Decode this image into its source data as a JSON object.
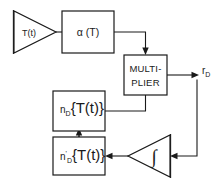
{
  "diagram": {
    "type": "block-diagram",
    "background_color": "#ffffff",
    "line_color": "#1a1a1a",
    "nodes": [
      {
        "id": "input-amplifier",
        "shape": "triangle-right",
        "label": "T(t)",
        "x": 12,
        "y": 11,
        "w": 44,
        "h": 42
      },
      {
        "id": "alpha-block",
        "shape": "rectangle",
        "label": "α (T)",
        "x": 62,
        "y": 11,
        "w": 52,
        "h": 42
      },
      {
        "id": "multiplier-block",
        "shape": "rectangle",
        "label_line_1": "MULTI-",
        "label_line_2": "PLIER",
        "x": 124,
        "y": 55,
        "w": 43,
        "h": 40
      },
      {
        "id": "nd-block",
        "shape": "rectangle",
        "label_base": "n",
        "label_sub": "D",
        "label_arg": "{T(t)}",
        "label_prime": "",
        "x": 53,
        "y": 91,
        "w": 52,
        "h": 40
      },
      {
        "id": "nd-prime-block",
        "shape": "rectangle",
        "label_base": "n",
        "label_sub": "D",
        "label_arg": "{T(t)}",
        "label_prime": "'",
        "x": 53,
        "y": 137,
        "w": 52,
        "h": 38
      },
      {
        "id": "integrator",
        "shape": "triangle-left",
        "label": "∫",
        "x": 128,
        "y": 135,
        "w": 42,
        "h": 42
      }
    ],
    "output_label": {
      "id": "output-rd",
      "base": "r",
      "sub": "D",
      "x": 203,
      "y": 72
    },
    "edges": [
      {
        "id": "edge-input-to-alpha",
        "from": "input-amplifier",
        "to": "alpha-block",
        "arrow": false
      },
      {
        "id": "edge-alpha-to-multiplier",
        "from": "alpha-block",
        "to": "multiplier-block",
        "arrow": true
      },
      {
        "id": "edge-nd-to-multiplier",
        "from": "nd-block",
        "to": "multiplier-block",
        "arrow": false
      },
      {
        "id": "edge-multiplier-to-output",
        "from": "multiplier-block",
        "to": "output-rd",
        "arrow": true
      },
      {
        "id": "edge-output-to-integrator",
        "from": "output-rd",
        "to": "integrator",
        "arrow": true
      },
      {
        "id": "edge-integrator-to-nd-prime",
        "from": "integrator",
        "to": "nd-prime-block",
        "arrow": true
      },
      {
        "id": "edge-nd-prime-to-nd",
        "from": "nd-prime-block",
        "to": "nd-block",
        "arrow": true
      }
    ]
  }
}
